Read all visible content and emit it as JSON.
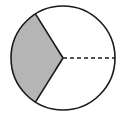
{
  "diagram": {
    "type": "circle-sectors",
    "center": [
      63,
      58
    ],
    "radius": 52,
    "shaded_sector": {
      "start_deg": 122,
      "end_deg": 238,
      "fill": "#b5b5b5"
    },
    "solid_radii_deg": [
      122,
      238
    ],
    "dashed_radius_deg": 0,
    "stroke": "#1a1a1a",
    "background": "#ffffff"
  }
}
